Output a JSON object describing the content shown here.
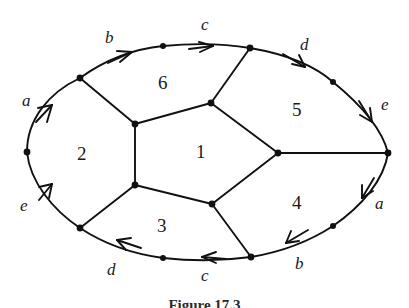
{
  "figure": {
    "caption": "Figure 17.3",
    "stroke_color": "#111111",
    "background_color": "#ffffff",
    "vertex_color": "#111111"
  },
  "face_labels": [
    {
      "text": "1",
      "x": 200,
      "y": 152
    },
    {
      "text": "2",
      "x": 81,
      "y": 154
    },
    {
      "text": "3",
      "x": 161,
      "y": 226
    },
    {
      "text": "4",
      "x": 296,
      "y": 203
    },
    {
      "text": "5",
      "x": 296,
      "y": 110
    },
    {
      "text": "6",
      "x": 162,
      "y": 83
    }
  ],
  "edge_labels": [
    {
      "text": "a",
      "x": 27,
      "y": 101,
      "position": "upper-left"
    },
    {
      "text": "b",
      "x": 110,
      "y": 39,
      "position": "upper-left-top"
    },
    {
      "text": "c",
      "x": 205,
      "y": 26,
      "position": "top"
    },
    {
      "text": "d",
      "x": 305,
      "y": 46,
      "position": "upper-right"
    },
    {
      "text": "e",
      "x": 386,
      "y": 106,
      "position": "right-upper"
    },
    {
      "text": "a",
      "x": 380,
      "y": 205,
      "position": "right-lower"
    },
    {
      "text": "b",
      "x": 300,
      "y": 265,
      "position": "lower-right"
    },
    {
      "text": "c",
      "x": 205,
      "y": 277,
      "position": "bottom"
    },
    {
      "text": "d",
      "x": 112,
      "y": 271,
      "position": "lower-left"
    },
    {
      "text": "e",
      "x": 25,
      "y": 206,
      "position": "left-lower"
    }
  ],
  "boundary_vertices": [
    {
      "name": "left",
      "x": 27,
      "y": 152
    },
    {
      "name": "upper-left",
      "x": 80,
      "y": 78
    },
    {
      "name": "top-right",
      "x": 250,
      "y": 48
    },
    {
      "name": "right",
      "x": 388,
      "y": 153
    },
    {
      "name": "bottom-right",
      "x": 251,
      "y": 257
    },
    {
      "name": "bottom-left",
      "x": 80,
      "y": 228
    }
  ],
  "boundary_midpoints": [
    {
      "name": "mid-b",
      "x": 163,
      "y": 46
    },
    {
      "name": "mid-d",
      "x": 333,
      "y": 82
    },
    {
      "name": "mid-a",
      "x": 333,
      "y": 226
    },
    {
      "name": "mid-c",
      "x": 163,
      "y": 258
    }
  ],
  "interior_vertices": [
    {
      "name": "inner-upper-left",
      "x": 135,
      "y": 124
    },
    {
      "name": "inner-lower-left",
      "x": 135,
      "y": 185
    },
    {
      "name": "inner-top",
      "x": 211,
      "y": 103
    },
    {
      "name": "inner-bottom",
      "x": 212,
      "y": 204
    },
    {
      "name": "inner-right",
      "x": 278,
      "y": 153
    }
  ],
  "arrows": [
    {
      "label": "a",
      "direction": "up",
      "on": "left-upper-arc"
    },
    {
      "label": "b",
      "direction": "right",
      "on": "top-left-arc"
    },
    {
      "label": "c",
      "direction": "right",
      "on": "top-right-arc"
    },
    {
      "label": "d",
      "direction": "down",
      "on": "upper-right-arc"
    },
    {
      "label": "e",
      "direction": "down",
      "on": "right-upper-arc"
    },
    {
      "label": "a",
      "direction": "down",
      "on": "right-lower-arc"
    },
    {
      "label": "b",
      "direction": "left",
      "on": "lower-right-arc"
    },
    {
      "label": "c",
      "direction": "left",
      "on": "bottom-arc"
    },
    {
      "label": "d",
      "direction": "left",
      "on": "lower-left-arc"
    },
    {
      "label": "e",
      "direction": "up",
      "on": "left-lower-arc"
    }
  ]
}
